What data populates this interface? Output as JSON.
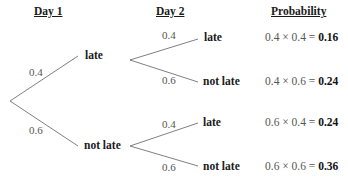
{
  "headings": {
    "day1": "Day 1",
    "day2": "Day 2",
    "probability": "Probability"
  },
  "day1": {
    "branches": [
      {
        "prob": "0.4",
        "outcome": "late"
      },
      {
        "prob": "0.6",
        "outcome": "not late"
      }
    ]
  },
  "day2": {
    "late_branch": [
      {
        "prob": "0.4",
        "outcome": "late"
      },
      {
        "prob": "0.6",
        "outcome": "not late"
      }
    ],
    "not_late_branch": [
      {
        "prob": "0.4",
        "outcome": "late"
      },
      {
        "prob": "0.6",
        "outcome": "not late"
      }
    ]
  },
  "results": [
    {
      "expr": "0.4 × 0.4 = ",
      "value": "0.16"
    },
    {
      "expr": "0.4 × 0.6 = ",
      "value": "0.24"
    },
    {
      "expr": "0.6 × 0.4 = ",
      "value": "0.24"
    },
    {
      "expr": "0.6 × 0.6 = ",
      "value": "0.36"
    }
  ],
  "colors": {
    "line": "#808080",
    "text": "#1a1a1a",
    "muted_text": "#555555"
  }
}
